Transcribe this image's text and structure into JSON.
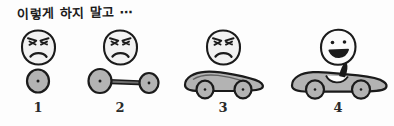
{
  "illustration": {
    "caption": "이렇게 하지 말고 ⋯",
    "style": "hand-drawn sketch",
    "colors": {
      "ink": "#1b1b1b",
      "fill_gray": "#b3b3b3",
      "face_fill": "#f2f2f2",
      "background": "#fdfdfd"
    },
    "steps": [
      {
        "number": "1",
        "face": "angry-face",
        "face_mood": "angry",
        "vehicle": "single-wheel",
        "vehicle_label": "wheel"
      },
      {
        "number": "2",
        "face": "angry-face",
        "face_mood": "angry",
        "vehicle": "two-wheel-axle",
        "vehicle_label": "axle with two wheels"
      },
      {
        "number": "3",
        "face": "angry-face",
        "face_mood": "angry",
        "vehicle": "car-body",
        "vehicle_label": "car without driver"
      },
      {
        "number": "4",
        "face": "happy-face",
        "face_mood": "happy",
        "vehicle": "convertible-with-driver",
        "vehicle_label": "finished convertible with driver"
      }
    ]
  }
}
